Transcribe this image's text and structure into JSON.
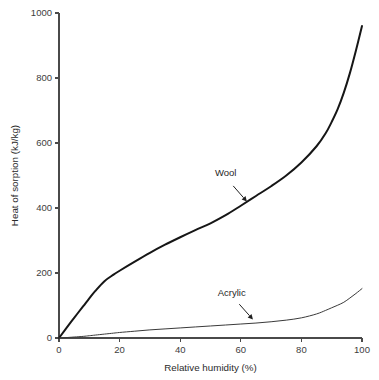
{
  "chart_data": {
    "type": "line",
    "title": "",
    "subtitle": "",
    "xlabel": "Relative humidity (%)",
    "ylabel": "Heat of sorption (kJ/kg)",
    "xlim": [
      0,
      100
    ],
    "ylim": [
      0,
      1000
    ],
    "xticks": [
      0,
      20,
      40,
      60,
      80,
      100
    ],
    "yticks": [
      0,
      200,
      400,
      600,
      800,
      1000
    ],
    "xtick_labels": [
      "0",
      "20",
      "40",
      "60",
      "80",
      "100"
    ],
    "ytick_labels": [
      "0",
      "200",
      "400",
      "600",
      "800",
      "1000"
    ],
    "grid": false,
    "legend": "none",
    "x": [
      0,
      2,
      5,
      8,
      10,
      12,
      15,
      18,
      20,
      25,
      30,
      35,
      40,
      45,
      50,
      55,
      60,
      65,
      70,
      75,
      80,
      85,
      88,
      90,
      92,
      94,
      96,
      98,
      100
    ],
    "series": [
      {
        "name": "Wool",
        "color": "#161616",
        "line_width": 2.0,
        "values": [
          0,
          25,
          62,
          98,
          122,
          145,
          175,
          195,
          207,
          235,
          262,
          287,
          310,
          332,
          353,
          378,
          407,
          437,
          467,
          500,
          540,
          590,
          630,
          665,
          705,
          755,
          815,
          885,
          960
        ],
        "annotation": {
          "text": "Wool",
          "text_x": 55,
          "text_y": 497,
          "arrow_from_x": 57.5,
          "arrow_from_y": 468,
          "arrow_to_x": 62,
          "arrow_to_y": 420
        }
      },
      {
        "name": "Acrylic",
        "color": "#3a3a3a",
        "line_width": 1.0,
        "values": [
          0,
          1,
          3,
          5,
          7,
          9,
          12,
          15,
          17,
          21,
          25,
          28,
          31,
          34,
          37,
          40,
          43,
          46,
          50,
          55,
          62,
          74,
          85,
          93,
          101,
          110,
          123,
          137,
          152
        ],
        "annotation": {
          "text": "Acrylic",
          "text_x": 57,
          "text_y": 130,
          "arrow_from_x": 59.5,
          "arrow_from_y": 104,
          "arrow_to_x": 64,
          "arrow_to_y": 57
        }
      }
    ]
  }
}
